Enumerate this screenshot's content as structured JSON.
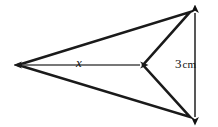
{
  "figure": {
    "kind": "geometry-diagram",
    "background_color": "#ffffff",
    "stroke_color": "#1a1a1a",
    "dimension_color": "#111111",
    "shape": {
      "name": "dart-quadrilateral",
      "stroke_width": 2.6,
      "vertices": [
        {
          "name": "left-apex",
          "x": 18,
          "y": 65
        },
        {
          "name": "top-right",
          "x": 190,
          "y": 12
        },
        {
          "name": "notch",
          "x": 143,
          "y": 65
        },
        {
          "name": "bottom-right",
          "x": 190,
          "y": 117
        }
      ]
    },
    "dimensions": [
      {
        "name": "base-dimension",
        "label": "x",
        "italic": true,
        "orientation": "horizontal",
        "from": {
          "x": 22,
          "y": 65
        },
        "to": {
          "x": 140,
          "y": 65
        },
        "arrows": "both",
        "label_x": 76,
        "label_y": 56
      },
      {
        "name": "height-dimension",
        "label_value": "3",
        "label_unit": "cm",
        "label_full": "3 cm",
        "orientation": "vertical",
        "from": {
          "x": 195,
          "y": 13
        },
        "to": {
          "x": 195,
          "y": 117
        },
        "arrows": "both",
        "label_x": 175,
        "label_y": 57
      }
    ]
  }
}
